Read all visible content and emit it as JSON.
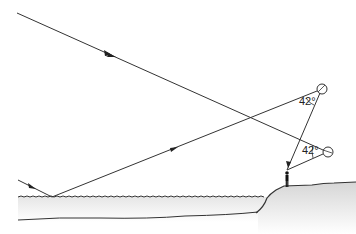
{
  "diagram": {
    "angles": [
      {
        "label": "42°",
        "at": "upper-droplet"
      },
      {
        "label": "42°",
        "at": "lower-droplet"
      }
    ],
    "elements": [
      "incoming-sunray-top",
      "incoming-sunray-low",
      "reflection-off-water",
      "upper-raindrop",
      "lower-raindrop",
      "observer",
      "water-surface",
      "shore-ground"
    ],
    "colors": {
      "line": "#333333",
      "ground_top": "#d9d9d9",
      "ground_bottom": "#ffffff",
      "water": "#f2f2f2"
    }
  }
}
